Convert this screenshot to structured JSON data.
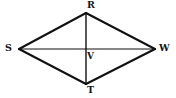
{
  "figure": {
    "name": "rhombus-rsvw-t",
    "shape_type": "rhombus",
    "background_color": "#ffffff",
    "stroke_color": "#111111",
    "edge_stroke_width": 2,
    "diagonal_stroke_width": 1.2,
    "canvas": {
      "width": 176,
      "height": 98
    },
    "vertices": [
      {
        "id": "R",
        "label": "R",
        "x": 86,
        "y": 13,
        "role": "top-vertex"
      },
      {
        "id": "S",
        "label": "S",
        "x": 19,
        "y": 49,
        "role": "left-vertex"
      },
      {
        "id": "W",
        "label": "W",
        "x": 155,
        "y": 49,
        "role": "right-vertex"
      },
      {
        "id": "T",
        "label": "T",
        "x": 86,
        "y": 84,
        "role": "bottom-vertex"
      },
      {
        "id": "V",
        "label": "V",
        "x": 86,
        "y": 49,
        "role": "diagonal-intersection"
      }
    ],
    "edges": [
      {
        "id": "SR",
        "from": "S",
        "to": "R",
        "kind": "side"
      },
      {
        "id": "RW",
        "from": "R",
        "to": "W",
        "kind": "side"
      },
      {
        "id": "WT",
        "from": "W",
        "to": "T",
        "kind": "side"
      },
      {
        "id": "TS",
        "from": "T",
        "to": "S",
        "kind": "side"
      }
    ],
    "diagonals": [
      {
        "id": "SW",
        "from": "S",
        "to": "W",
        "kind": "horizontal-diagonal"
      },
      {
        "id": "RT",
        "from": "R",
        "to": "T",
        "kind": "vertical-diagonal"
      }
    ],
    "labels": {
      "R": "R",
      "S": "S",
      "W": "W",
      "T": "T",
      "V": "V"
    }
  }
}
